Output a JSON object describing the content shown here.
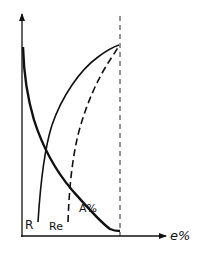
{
  "diagram": {
    "type": "stress-strain property curves",
    "axes": {
      "x_label": "e%",
      "y_label": ""
    },
    "curves": [
      {
        "id": "R",
        "label": "R",
        "style": "solid",
        "description": "rising curve (strength R) increasing with e%"
      },
      {
        "id": "Re",
        "label": "Re",
        "style": "dashed",
        "description": "rising dashed curve (yield strength Re) increasing with e%"
      },
      {
        "id": "A",
        "label": "A%",
        "style": "solid-thick",
        "description": "falling curve (elongation A%) decreasing with e%"
      }
    ],
    "reference_line": {
      "style": "dashed",
      "orientation": "vertical",
      "description": "limit of e%"
    }
  },
  "colors": {
    "line": "#111111",
    "background": "#ffffff"
  }
}
